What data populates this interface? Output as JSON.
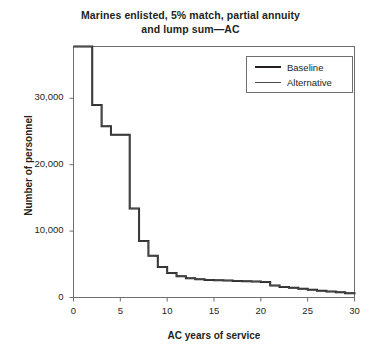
{
  "chart_data": {
    "type": "line",
    "title": "Marines enlisted, 5% match, partial annuity and lump sum—AC",
    "title_lines": [
      "Marines enlisted, 5% match, partial annuity",
      "and lump sum—AC"
    ],
    "xlabel": "AC years of service",
    "ylabel": "Number of personnel",
    "xlim": [
      0,
      30
    ],
    "ylim": [
      0,
      37800
    ],
    "grid": false,
    "legend_position": "top-right",
    "xticks": [
      0,
      5,
      10,
      15,
      20,
      25,
      30
    ],
    "xtick_labels": [
      "0",
      "5",
      "10",
      "15",
      "20",
      "25",
      "30"
    ],
    "yticks": [
      0,
      10000,
      20000,
      30000
    ],
    "ytick_labels": [
      "0",
      "10,000",
      "20,000",
      "30,000"
    ],
    "step_style": "post",
    "x": [
      0,
      1,
      2,
      3,
      4,
      5,
      6,
      7,
      8,
      9,
      10,
      11,
      12,
      13,
      14,
      15,
      16,
      17,
      18,
      19,
      20,
      21,
      22,
      23,
      24,
      25,
      26,
      27,
      28,
      29,
      30
    ],
    "series": [
      {
        "name": "Baseline",
        "color": "#231f20",
        "line_width": 2,
        "values": [
          37800,
          37800,
          29000,
          25800,
          24500,
          24500,
          13400,
          8500,
          6300,
          4600,
          3700,
          3200,
          2900,
          2750,
          2650,
          2600,
          2550,
          2500,
          2450,
          2400,
          2350,
          1800,
          1600,
          1450,
          1300,
          1150,
          1000,
          900,
          800,
          650,
          500
        ]
      },
      {
        "name": "Alternative",
        "color": "#4d4d4f",
        "line_width": 1,
        "values": [
          37800,
          37800,
          29000,
          25800,
          24500,
          24500,
          13400,
          8500,
          6300,
          4600,
          3700,
          3200,
          2900,
          2750,
          2650,
          2600,
          2550,
          2500,
          2450,
          2400,
          2350,
          1800,
          1600,
          1450,
          1300,
          1150,
          1000,
          900,
          800,
          650,
          500
        ]
      }
    ]
  },
  "legend": {
    "entries": [
      {
        "label": "Baseline"
      },
      {
        "label": "Alternative"
      }
    ]
  }
}
